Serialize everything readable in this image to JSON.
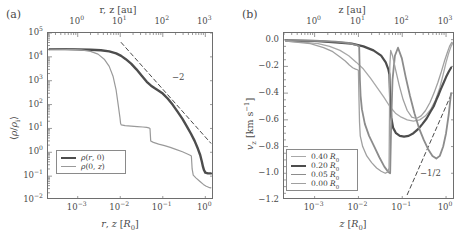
{
  "figure": {
    "panels": [
      {
        "tag": "(a)",
        "top_axis_label": "r, z [au]",
        "bottom_axis_label": "r, z [R0]",
        "y_axis_label": "⟨ρ/ρi⟩",
        "top_ticks": [
          "10^0",
          "10^1",
          "10^2",
          "10^3"
        ],
        "bottom_ticks": [
          "10^-3",
          "10^-2",
          "10^-1",
          "10^0"
        ],
        "y_ticks": [
          "10^5",
          "10^4",
          "10^3",
          "10^2",
          "10^1",
          "10^0",
          "10^-1",
          "10^-2"
        ],
        "slope_annotation": "−2",
        "legend": [
          {
            "label": "ρ(r, 0)",
            "color": "#4d4d4d",
            "width": 2.4
          },
          {
            "label": "ρ(0, z)",
            "color": "#9a9a9a",
            "width": 1.2
          }
        ]
      },
      {
        "tag": "(b)",
        "top_axis_label": "z [au]",
        "bottom_axis_label": "z [R0]",
        "y_axis_label": "vz [km s⁻¹]",
        "top_ticks": [
          "10^0",
          "10^1",
          "10^2",
          "10^3"
        ],
        "bottom_ticks": [
          "10^-3",
          "10^-2",
          "10^-1",
          "10^0"
        ],
        "y_ticks": [
          "0.0",
          "−0.2",
          "−0.4",
          "−0.6",
          "−0.8",
          "−1.0",
          "−1.2"
        ],
        "slope_annotation": "−1/2",
        "legend": [
          {
            "label": "0.40 R0",
            "color": "#a8a8a8",
            "width": 1.3
          },
          {
            "label": "0.20 R0",
            "color": "#4d4d4d",
            "width": 2.2
          },
          {
            "label": "0.05 R0",
            "color": "#8c8c8c",
            "width": 1.8
          },
          {
            "label": "0.00 R0",
            "color": "#a0a0a0",
            "width": 1.3
          }
        ]
      }
    ]
  },
  "chart_data": [
    {
      "type": "line",
      "panel": "(a)",
      "title": "",
      "xlabel": "r, z [R0]",
      "ylabel": "<rho/rho_i>",
      "xscale": "log",
      "yscale": "log",
      "xlim": [
        0.0002,
        1.6
      ],
      "ylim": [
        0.01,
        100000
      ],
      "top_axis": {
        "label": "r, z [au]",
        "ticks": [
          1,
          10,
          100,
          1000
        ]
      },
      "grid": false,
      "legend_position": "lower-left",
      "series": [
        {
          "name": "rho(r, 0)",
          "color": "#4d4d4d",
          "width": 2.4,
          "x": [
            0.00022,
            0.0005,
            0.001,
            0.002,
            0.0035,
            0.0055,
            0.008,
            0.0105,
            0.0135,
            0.018,
            0.024,
            0.032,
            0.042,
            0.053,
            0.065,
            0.08,
            0.1,
            0.13,
            0.17,
            0.22,
            0.29,
            0.37,
            0.46,
            0.56,
            0.67,
            0.76,
            0.83,
            0.88,
            0.93,
            1.0,
            1.15,
            1.35
          ],
          "y": [
            21000,
            21000,
            20500,
            20000,
            19000,
            17000,
            14000,
            11000,
            8000,
            5200,
            3000,
            1600,
            900,
            620,
            480,
            380,
            290,
            180,
            100,
            52,
            25,
            12,
            6.0,
            3.0,
            1.4,
            0.75,
            0.4,
            0.25,
            0.18,
            0.14,
            0.13,
            0.13
          ]
        },
        {
          "name": "rho(0, z)",
          "color": "#9a9a9a",
          "width": 1.2,
          "x": [
            0.00022,
            0.0006,
            0.0012,
            0.002,
            0.003,
            0.0042,
            0.0055,
            0.0068,
            0.008,
            0.009,
            0.0098,
            0.0102,
            0.0106,
            0.013,
            0.018,
            0.025,
            0.034,
            0.042,
            0.047,
            0.05,
            0.052,
            0.06,
            0.08,
            0.11,
            0.15,
            0.21,
            0.29,
            0.38,
            0.44,
            0.47,
            0.49,
            0.52,
            0.6,
            0.75,
            0.9,
            1.05,
            1.2,
            1.35
          ],
          "y": [
            21000,
            20500,
            19500,
            17000,
            13000,
            8000,
            4000,
            1500,
            400,
            90,
            30,
            16,
            14,
            13,
            12.5,
            12,
            11.5,
            11,
            10.5,
            10,
            3.0,
            2.6,
            2.2,
            1.9,
            1.6,
            1.3,
            1.05,
            0.85,
            0.75,
            0.7,
            0.2,
            0.11,
            0.085,
            0.06,
            0.045,
            0.038,
            0.034,
            0.032
          ]
        }
      ],
      "reference_lines": [
        {
          "label": "-2",
          "slope": -2,
          "style": "dashed",
          "color": "#4a4a4a",
          "x": [
            0.0105,
            1.35
          ],
          "y": [
            40000,
            2.4
          ]
        }
      ]
    },
    {
      "type": "line",
      "panel": "(b)",
      "title": "",
      "xlabel": "z [R0]",
      "ylabel": "v_z [km s^-1]",
      "xscale": "log",
      "yscale": "linear",
      "xlim": [
        0.0002,
        1.6
      ],
      "ylim": [
        -1.2,
        0.05
      ],
      "top_axis": {
        "label": "z [au]",
        "ticks": [
          1,
          10,
          100,
          1000
        ]
      },
      "grid": false,
      "legend_position": "lower-left",
      "series": [
        {
          "name": "0.40 R0",
          "color": "#a8a8a8",
          "width": 1.3,
          "x": [
            0.00022,
            0.0006,
            0.0012,
            0.0022,
            0.0038,
            0.006,
            0.009,
            0.013,
            0.019,
            0.027,
            0.038,
            0.052,
            0.07,
            0.095,
            0.13,
            0.18,
            0.25,
            0.34,
            0.45,
            0.58,
            0.72,
            0.86,
            1.0,
            1.15,
            1.3,
            1.45
          ],
          "y": [
            -0.01,
            -0.02,
            -0.03,
            -0.05,
            -0.08,
            -0.12,
            -0.17,
            -0.22,
            -0.29,
            -0.36,
            -0.43,
            -0.5,
            -0.55,
            -0.58,
            -0.6,
            -0.61,
            -0.6,
            -0.57,
            -0.52,
            -0.45,
            -0.36,
            -0.26,
            -0.17,
            -0.1,
            -0.05,
            -0.02
          ]
        },
        {
          "name": "0.20 R0",
          "color": "#4d4d4d",
          "width": 2.2,
          "x": [
            0.00022,
            0.001,
            0.003,
            0.007,
            0.013,
            0.022,
            0.033,
            0.042,
            0.048,
            0.051,
            0.053,
            0.056,
            0.062,
            0.072,
            0.088,
            0.11,
            0.14,
            0.18,
            0.23,
            0.29,
            0.36,
            0.44,
            0.52,
            0.6,
            0.68,
            0.76,
            0.86,
            1.0,
            1.15,
            1.3
          ],
          "y": [
            -0.005,
            -0.01,
            -0.02,
            -0.03,
            -0.05,
            -0.08,
            -0.12,
            -0.17,
            -0.22,
            -0.26,
            -0.45,
            -0.58,
            -0.66,
            -0.7,
            -0.72,
            -0.725,
            -0.72,
            -0.7,
            -0.67,
            -0.63,
            -0.59,
            -0.54,
            -0.5,
            -0.45,
            -0.41,
            -0.37,
            -0.33,
            -0.28,
            -0.24,
            -0.21
          ]
        },
        {
          "name": "0.05 R0",
          "color": "#8c8c8c",
          "width": 1.8,
          "x": [
            0.00022,
            0.001,
            0.003,
            0.006,
            0.009,
            0.0104,
            0.0108,
            0.0112,
            0.012,
            0.014,
            0.0175,
            0.023,
            0.03,
            0.039,
            0.048,
            0.053,
            0.056,
            0.06,
            0.068,
            0.08,
            0.098,
            0.12,
            0.15,
            0.19,
            0.24,
            0.31,
            0.39,
            0.49,
            0.6,
            0.72,
            0.86,
            1.0,
            1.15,
            1.3
          ],
          "y": [
            -0.004,
            -0.008,
            -0.015,
            -0.025,
            -0.04,
            -0.05,
            -0.3,
            -0.42,
            -0.52,
            -0.63,
            -0.72,
            -0.8,
            -0.88,
            -0.95,
            -0.99,
            -1.0,
            -0.62,
            -0.3,
            -0.12,
            -0.06,
            -0.14,
            -0.28,
            -0.42,
            -0.55,
            -0.66,
            -0.75,
            -0.82,
            -0.87,
            -0.89,
            -0.87,
            -0.8,
            -0.7,
            -0.56,
            -0.4
          ]
        },
        {
          "name": "0.00 R0",
          "color": "#a0a0a0",
          "width": 1.3,
          "x": [
            0.00022,
            0.0008,
            0.0016,
            0.0026,
            0.0038,
            0.005,
            0.0062,
            0.0074,
            0.0086,
            0.0095,
            0.01,
            0.0103,
            0.0106,
            0.011,
            0.0125,
            0.0155,
            0.02,
            0.026,
            0.033,
            0.041,
            0.047,
            0.05,
            0.0512,
            0.052,
            0.0545,
            0.06,
            0.07,
            0.085,
            0.105,
            0.13,
            0.165,
            0.21,
            0.27,
            0.34,
            0.43,
            0.53,
            0.65,
            0.78,
            0.92,
            1.06,
            1.2,
            1.35
          ],
          "y": [
            -0.01,
            -0.03,
            -0.06,
            -0.09,
            -0.13,
            -0.16,
            -0.19,
            -0.21,
            -0.22,
            -0.225,
            -0.23,
            -0.45,
            -0.62,
            -0.72,
            -0.8,
            -0.87,
            -0.92,
            -0.96,
            -0.985,
            -1.0,
            -0.99,
            -0.96,
            -0.55,
            -0.2,
            -0.08,
            -0.12,
            -0.22,
            -0.34,
            -0.45,
            -0.53,
            -0.58,
            -0.59,
            -0.57,
            -0.53,
            -0.47,
            -0.4,
            -0.32,
            -0.24,
            -0.16,
            -0.1,
            -0.05,
            -0.02
          ]
        }
      ],
      "reference_lines": [
        {
          "label": "-1/2",
          "slope": -0.5,
          "style": "dashed",
          "color": "#4a4a4a",
          "x": [
            0.13,
            1.35
          ],
          "y": [
            -1.16,
            -0.4
          ]
        }
      ]
    }
  ]
}
